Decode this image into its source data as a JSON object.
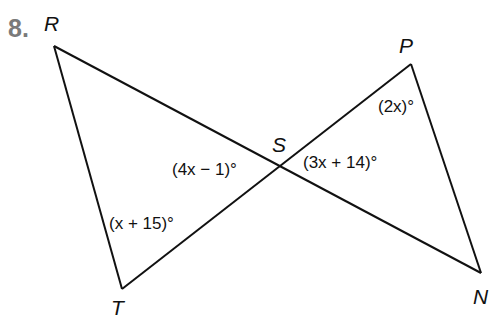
{
  "problem": {
    "number": "8.",
    "points": {
      "R": {
        "label": "R",
        "x": 54,
        "y": 46
      },
      "P": {
        "label": "P",
        "x": 411,
        "y": 64
      },
      "N": {
        "label": "N",
        "x": 481,
        "y": 273
      },
      "T": {
        "label": "T",
        "x": 122,
        "y": 289
      },
      "S": {
        "label": "S",
        "x": 281,
        "y": 168
      }
    },
    "segments": [
      [
        "R",
        "N"
      ],
      [
        "T",
        "P"
      ],
      [
        "R",
        "T"
      ],
      [
        "P",
        "N"
      ]
    ],
    "angles": {
      "P": "(2x)°",
      "S_right": "(3x + 14)°",
      "S_left": "(4x − 1)°",
      "T": "(x + 15)°"
    },
    "line_color": "#111111",
    "number_color": "#7a7a7a"
  }
}
